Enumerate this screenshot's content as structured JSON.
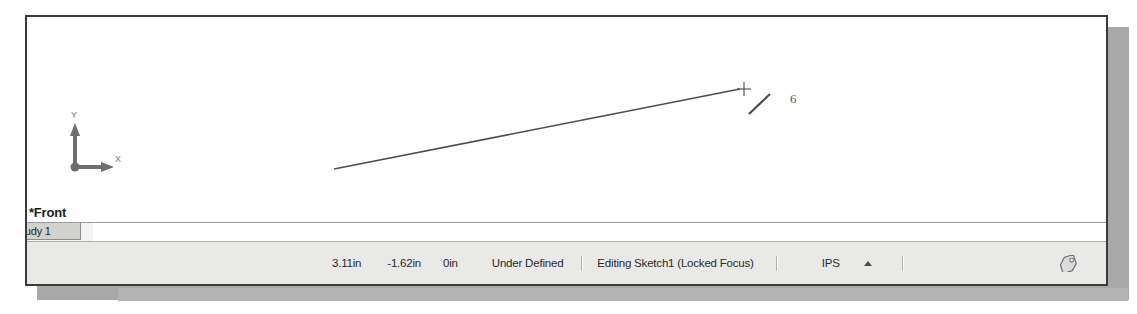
{
  "window": {
    "title": "SolidWorks Graphics Window"
  },
  "graphics": {
    "view_label": "*Front",
    "axis_triad": {
      "y_label": "Y",
      "x_label": "X",
      "name": "origin-triad"
    },
    "sketch": {
      "dimension_label": "6",
      "line_name": "sketch-line-1",
      "endpoint_name": "sketch-endpoint"
    },
    "background_color": "#ffffff"
  },
  "tabs": {
    "items": [
      {
        "label": "tudy 1",
        "active": true
      }
    ]
  },
  "status_bar": {
    "coordinate_x": "3.11in",
    "coordinate_y": "-1.62in",
    "coordinate_z": "0in",
    "sketch_state": "Under Defined",
    "edit_state": "Editing Sketch1 (Locked Focus)",
    "units": "IPS",
    "units_arrow_icon": "triangle-up-icon",
    "tag_icon": "tag-icon",
    "background_color": "#e9e9e7"
  }
}
